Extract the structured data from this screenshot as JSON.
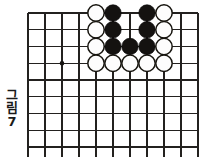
{
  "figure": {
    "caption_chars": [
      "그",
      "림"
    ],
    "caption_number": "7",
    "caption_full": "그림 7"
  },
  "board": {
    "kind": "go-board-diagram",
    "grid": {
      "columns": 11,
      "rows": 9,
      "origin_x": 28,
      "origin_y": 13,
      "spacing_x": 17,
      "spacing_y": 16.75,
      "top_edge_thick": true,
      "right_edge_thick": true
    },
    "star_points": [
      {
        "col": 2,
        "row": 3
      }
    ],
    "stones": [
      {
        "col": 4,
        "row": 0,
        "color": "white"
      },
      {
        "col": 5,
        "row": 0,
        "color": "black"
      },
      {
        "col": 7,
        "row": 0,
        "color": "black"
      },
      {
        "col": 8,
        "row": 0,
        "color": "white"
      },
      {
        "col": 4,
        "row": 1,
        "color": "white"
      },
      {
        "col": 5,
        "row": 1,
        "color": "black"
      },
      {
        "col": 7,
        "row": 1,
        "color": "black"
      },
      {
        "col": 8,
        "row": 1,
        "color": "white"
      },
      {
        "col": 4,
        "row": 2,
        "color": "white"
      },
      {
        "col": 5,
        "row": 2,
        "color": "black"
      },
      {
        "col": 6,
        "row": 2,
        "color": "black"
      },
      {
        "col": 7,
        "row": 2,
        "color": "black"
      },
      {
        "col": 8,
        "row": 2,
        "color": "white"
      },
      {
        "col": 4,
        "row": 3,
        "color": "white"
      },
      {
        "col": 5,
        "row": 3,
        "color": "white"
      },
      {
        "col": 6,
        "row": 3,
        "color": "white"
      },
      {
        "col": 7,
        "row": 3,
        "color": "white"
      },
      {
        "col": 8,
        "row": 3,
        "color": "white"
      }
    ],
    "empty_marked_points": [
      {
        "col": 6,
        "row": 0
      },
      {
        "col": 6,
        "row": 1
      }
    ],
    "stone_radius": 8.2,
    "colors": {
      "line": "#23211f",
      "black_stone": "#141210",
      "white_stone_fill": "#fdfdfd",
      "white_stone_outline": "#17150f",
      "background": "#ffffff",
      "caption_text": "#1a1a1a"
    }
  }
}
